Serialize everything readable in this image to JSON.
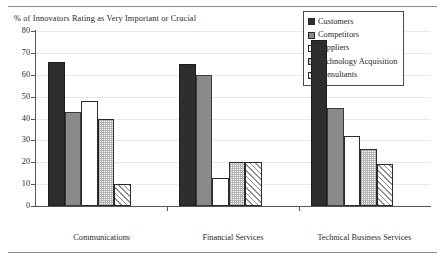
{
  "chart_data": {
    "type": "bar",
    "title": "% of Innovators Rating as Very Important or Crucial",
    "xlabel": "",
    "ylabel": "",
    "ylim": [
      0,
      80
    ],
    "ytick_step": 10,
    "grid": true,
    "legend_position": "top-right",
    "categories": [
      "Communications",
      "Financial Services",
      "Technical Business Services"
    ],
    "series": [
      {
        "name": "Customers",
        "values": [
          66,
          65,
          76
        ],
        "fill": "solid-black",
        "color": "#2e2e2e"
      },
      {
        "name": "Competitors",
        "values": [
          43,
          60,
          45
        ],
        "fill": "solid-gray",
        "color": "#8a8a8a"
      },
      {
        "name": "Suppliers",
        "values": [
          48,
          13,
          32
        ],
        "fill": "solid-white",
        "color": "#ffffff"
      },
      {
        "name": "Technology Acquisition",
        "values": [
          40,
          20,
          26
        ],
        "fill": "dotted",
        "color": "#b4b4b4"
      },
      {
        "name": "Consultants",
        "values": [
          10,
          20,
          19
        ],
        "fill": "diagonal-hatch",
        "color": "#8f8f8f"
      }
    ],
    "yticks": [
      "0",
      "10",
      "20",
      "30",
      "40",
      "50",
      "60",
      "70",
      "80"
    ]
  },
  "legend": {
    "items": [
      {
        "label": "Customers"
      },
      {
        "label": "Competitors"
      },
      {
        "label": "Suppliers"
      },
      {
        "label": "Technology Acquisition"
      },
      {
        "label": "Consultants"
      }
    ]
  },
  "colors": {
    "axis": "#555555",
    "grid": "#e9e9e9",
    "text": "#1a1a1a",
    "rule": "#8d8d8d"
  }
}
